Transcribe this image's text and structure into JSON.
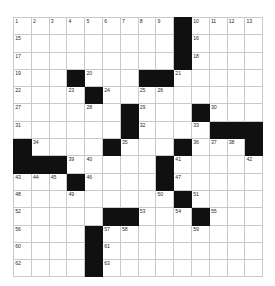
{
  "puzzle": {
    "kind": "crossword-grid",
    "columns": 14,
    "rows": 15,
    "colors": {
      "block_fill": "#101010",
      "open_fill": "#ffffff",
      "grid_line": "#c9c9c9",
      "number_text": "#2b2b2b"
    },
    "max_clue_number": 63,
    "grid": [
      [
        {
          "block": false,
          "num": "1"
        },
        {
          "block": false,
          "num": "2"
        },
        {
          "block": false,
          "num": "3"
        },
        {
          "block": false,
          "num": "4"
        },
        {
          "block": false,
          "num": "5"
        },
        {
          "block": false,
          "num": "6"
        },
        {
          "block": false,
          "num": "7"
        },
        {
          "block": false,
          "num": "8"
        },
        {
          "block": false,
          "num": "9"
        },
        {
          "block": true,
          "num": ""
        },
        {
          "block": false,
          "num": "10"
        },
        {
          "block": false,
          "num": "11"
        },
        {
          "block": false,
          "num": "12"
        },
        {
          "block": false,
          "num": "13"
        }
      ],
      [
        {
          "block": false,
          "num": "15"
        },
        {
          "block": false,
          "num": ""
        },
        {
          "block": false,
          "num": ""
        },
        {
          "block": false,
          "num": ""
        },
        {
          "block": false,
          "num": ""
        },
        {
          "block": false,
          "num": ""
        },
        {
          "block": false,
          "num": ""
        },
        {
          "block": false,
          "num": ""
        },
        {
          "block": false,
          "num": ""
        },
        {
          "block": true,
          "num": ""
        },
        {
          "block": false,
          "num": "16"
        },
        {
          "block": false,
          "num": ""
        },
        {
          "block": false,
          "num": ""
        },
        {
          "block": false,
          "num": ""
        }
      ],
      [
        {
          "block": false,
          "num": "17"
        },
        {
          "block": false,
          "num": ""
        },
        {
          "block": false,
          "num": ""
        },
        {
          "block": false,
          "num": ""
        },
        {
          "block": false,
          "num": ""
        },
        {
          "block": false,
          "num": ""
        },
        {
          "block": false,
          "num": ""
        },
        {
          "block": false,
          "num": ""
        },
        {
          "block": false,
          "num": ""
        },
        {
          "block": true,
          "num": ""
        },
        {
          "block": false,
          "num": "18"
        },
        {
          "block": false,
          "num": ""
        },
        {
          "block": false,
          "num": ""
        },
        {
          "block": false,
          "num": ""
        }
      ],
      [
        {
          "block": false,
          "num": "19"
        },
        {
          "block": false,
          "num": ""
        },
        {
          "block": false,
          "num": ""
        },
        {
          "block": true,
          "num": ""
        },
        {
          "block": false,
          "num": "20"
        },
        {
          "block": false,
          "num": ""
        },
        {
          "block": false,
          "num": ""
        },
        {
          "block": true,
          "num": ""
        },
        {
          "block": true,
          "num": ""
        },
        {
          "block": false,
          "num": "21"
        },
        {
          "block": false,
          "num": ""
        },
        {
          "block": false,
          "num": ""
        },
        {
          "block": false,
          "num": ""
        },
        {
          "block": false,
          "num": ""
        }
      ],
      [
        {
          "block": false,
          "num": "22"
        },
        {
          "block": false,
          "num": ""
        },
        {
          "block": false,
          "num": ""
        },
        {
          "block": false,
          "num": "23"
        },
        {
          "block": true,
          "num": ""
        },
        {
          "block": false,
          "num": "24"
        },
        {
          "block": false,
          "num": ""
        },
        {
          "block": false,
          "num": "25"
        },
        {
          "block": false,
          "num": "26"
        },
        {
          "block": false,
          "num": ""
        },
        {
          "block": false,
          "num": ""
        },
        {
          "block": false,
          "num": ""
        },
        {
          "block": false,
          "num": ""
        },
        {
          "block": false,
          "num": ""
        }
      ],
      [
        {
          "block": false,
          "num": "27"
        },
        {
          "block": false,
          "num": ""
        },
        {
          "block": false,
          "num": ""
        },
        {
          "block": false,
          "num": ""
        },
        {
          "block": false,
          "num": "28"
        },
        {
          "block": false,
          "num": ""
        },
        {
          "block": true,
          "num": ""
        },
        {
          "block": false,
          "num": "29"
        },
        {
          "block": false,
          "num": ""
        },
        {
          "block": false,
          "num": ""
        },
        {
          "block": true,
          "num": ""
        },
        {
          "block": false,
          "num": "30"
        },
        {
          "block": false,
          "num": ""
        },
        {
          "block": false,
          "num": ""
        }
      ],
      [
        {
          "block": false,
          "num": "31"
        },
        {
          "block": false,
          "num": ""
        },
        {
          "block": false,
          "num": ""
        },
        {
          "block": false,
          "num": ""
        },
        {
          "block": false,
          "num": ""
        },
        {
          "block": false,
          "num": ""
        },
        {
          "block": true,
          "num": ""
        },
        {
          "block": false,
          "num": "32"
        },
        {
          "block": false,
          "num": ""
        },
        {
          "block": false,
          "num": ""
        },
        {
          "block": false,
          "num": "33"
        },
        {
          "block": true,
          "num": ""
        },
        {
          "block": true,
          "num": ""
        },
        {
          "block": true,
          "num": ""
        }
      ],
      [
        {
          "block": true,
          "num": ""
        },
        {
          "block": false,
          "num": "34"
        },
        {
          "block": false,
          "num": ""
        },
        {
          "block": false,
          "num": ""
        },
        {
          "block": false,
          "num": ""
        },
        {
          "block": true,
          "num": ""
        },
        {
          "block": false,
          "num": "35"
        },
        {
          "block": false,
          "num": ""
        },
        {
          "block": false,
          "num": ""
        },
        {
          "block": true,
          "num": ""
        },
        {
          "block": false,
          "num": "36"
        },
        {
          "block": false,
          "num": "37"
        },
        {
          "block": false,
          "num": "38"
        },
        {
          "block": true,
          "num": ""
        }
      ],
      [
        {
          "block": true,
          "num": ""
        },
        {
          "block": true,
          "num": ""
        },
        {
          "block": true,
          "num": ""
        },
        {
          "block": false,
          "num": "39"
        },
        {
          "block": false,
          "num": "40"
        },
        {
          "block": false,
          "num": ""
        },
        {
          "block": false,
          "num": ""
        },
        {
          "block": false,
          "num": ""
        },
        {
          "block": true,
          "num": ""
        },
        {
          "block": false,
          "num": "41"
        },
        {
          "block": false,
          "num": ""
        },
        {
          "block": false,
          "num": ""
        },
        {
          "block": false,
          "num": ""
        },
        {
          "block": false,
          "num": "42"
        }
      ],
      [
        {
          "block": false,
          "num": "43"
        },
        {
          "block": false,
          "num": "44"
        },
        {
          "block": false,
          "num": "45"
        },
        {
          "block": true,
          "num": ""
        },
        {
          "block": false,
          "num": "46"
        },
        {
          "block": false,
          "num": ""
        },
        {
          "block": false,
          "num": ""
        },
        {
          "block": false,
          "num": ""
        },
        {
          "block": true,
          "num": ""
        },
        {
          "block": false,
          "num": "47"
        },
        {
          "block": false,
          "num": ""
        },
        {
          "block": false,
          "num": ""
        },
        {
          "block": false,
          "num": ""
        },
        {
          "block": false,
          "num": ""
        }
      ],
      [
        {
          "block": false,
          "num": "48"
        },
        {
          "block": false,
          "num": ""
        },
        {
          "block": false,
          "num": ""
        },
        {
          "block": false,
          "num": "49"
        },
        {
          "block": false,
          "num": ""
        },
        {
          "block": false,
          "num": ""
        },
        {
          "block": false,
          "num": ""
        },
        {
          "block": false,
          "num": ""
        },
        {
          "block": false,
          "num": "50"
        },
        {
          "block": true,
          "num": ""
        },
        {
          "block": false,
          "num": "51"
        },
        {
          "block": false,
          "num": ""
        },
        {
          "block": false,
          "num": ""
        },
        {
          "block": false,
          "num": ""
        }
      ],
      [
        {
          "block": false,
          "num": "52"
        },
        {
          "block": false,
          "num": ""
        },
        {
          "block": false,
          "num": ""
        },
        {
          "block": false,
          "num": ""
        },
        {
          "block": false,
          "num": ""
        },
        {
          "block": true,
          "num": ""
        },
        {
          "block": true,
          "num": ""
        },
        {
          "block": false,
          "num": "53"
        },
        {
          "block": false,
          "num": ""
        },
        {
          "block": false,
          "num": "54"
        },
        {
          "block": true,
          "num": ""
        },
        {
          "block": false,
          "num": "55"
        },
        {
          "block": false,
          "num": ""
        },
        {
          "block": false,
          "num": ""
        }
      ],
      [
        {
          "block": false,
          "num": "56"
        },
        {
          "block": false,
          "num": ""
        },
        {
          "block": false,
          "num": ""
        },
        {
          "block": false,
          "num": ""
        },
        {
          "block": true,
          "num": ""
        },
        {
          "block": false,
          "num": "57"
        },
        {
          "block": false,
          "num": "58"
        },
        {
          "block": false,
          "num": ""
        },
        {
          "block": false,
          "num": ""
        },
        {
          "block": false,
          "num": ""
        },
        {
          "block": false,
          "num": "59"
        },
        {
          "block": false,
          "num": ""
        },
        {
          "block": false,
          "num": ""
        },
        {
          "block": false,
          "num": ""
        }
      ],
      [
        {
          "block": false,
          "num": "60"
        },
        {
          "block": false,
          "num": ""
        },
        {
          "block": false,
          "num": ""
        },
        {
          "block": false,
          "num": ""
        },
        {
          "block": true,
          "num": ""
        },
        {
          "block": false,
          "num": "61"
        },
        {
          "block": false,
          "num": ""
        },
        {
          "block": false,
          "num": ""
        },
        {
          "block": false,
          "num": ""
        },
        {
          "block": false,
          "num": ""
        },
        {
          "block": false,
          "num": ""
        },
        {
          "block": false,
          "num": ""
        },
        {
          "block": false,
          "num": ""
        },
        {
          "block": false,
          "num": ""
        }
      ],
      [
        {
          "block": false,
          "num": "62"
        },
        {
          "block": false,
          "num": ""
        },
        {
          "block": false,
          "num": ""
        },
        {
          "block": false,
          "num": ""
        },
        {
          "block": true,
          "num": ""
        },
        {
          "block": false,
          "num": "63"
        },
        {
          "block": false,
          "num": ""
        },
        {
          "block": false,
          "num": ""
        },
        {
          "block": false,
          "num": ""
        },
        {
          "block": false,
          "num": ""
        },
        {
          "block": false,
          "num": ""
        },
        {
          "block": false,
          "num": ""
        },
        {
          "block": false,
          "num": ""
        },
        {
          "block": false,
          "num": ""
        }
      ]
    ]
  }
}
